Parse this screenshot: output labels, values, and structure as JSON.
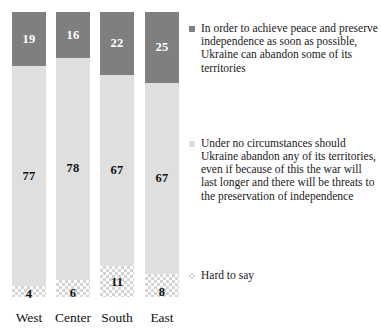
{
  "chart_data": {
    "type": "bar",
    "subtype": "stacked-100-percent",
    "title": "",
    "subtitle": "",
    "xlabel": "",
    "ylabel": "",
    "ylim": [
      0,
      100
    ],
    "grid": false,
    "legend_position": "right",
    "categories": [
      "West",
      "Center",
      "South",
      "East"
    ],
    "series": [
      {
        "name": "In order to achieve peace and preserve independence as soon as possible, Ukraine can abandon some of its territories",
        "short_name": "abandon-some-territories",
        "color": "#7f7f7f",
        "fill": "solid",
        "values": [
          19,
          16,
          22,
          25
        ]
      },
      {
        "name": "Under no circumstances should Ukraine abandon any of its territories, even if because of this the war will last longer and there will be threats to the preservation of independence",
        "short_name": "abandon-no-territories",
        "color": "#dfdfdf",
        "fill": "solid",
        "values": [
          77,
          78,
          67,
          67
        ]
      },
      {
        "name": "Hard to say",
        "short_name": "hard-to-say",
        "color": "#d5d5d5",
        "fill": "checkered",
        "values": [
          4,
          6,
          11,
          8
        ]
      }
    ]
  },
  "legend": {
    "items": [
      {
        "label": "In order to achieve peace and preserve independence as soon as possible, Ukraine can abandon some of its territories",
        "swatch": "dark-gray-square-icon",
        "color": "#7f7f7f"
      },
      {
        "label": "Under no circumstances should Ukraine abandon any of its territories, even if because of this the war will last longer and there will be threats to the preservation of independence",
        "swatch": "light-gray-square-icon",
        "color": "#dfdfdf"
      },
      {
        "label": "Hard to say",
        "swatch": "checkered-square-icon",
        "color": "#d5d5d5"
      }
    ]
  },
  "axis": {
    "categories": [
      "West",
      "Center",
      "South",
      "East"
    ]
  },
  "bars": [
    {
      "category": "West",
      "dark": "19",
      "light": "77",
      "check": "4"
    },
    {
      "category": "Center",
      "dark": "16",
      "light": "78",
      "check": "6"
    },
    {
      "category": "South",
      "dark": "22",
      "light": "67",
      "check": "11"
    },
    {
      "category": "East",
      "dark": "25",
      "light": "67",
      "check": "8"
    }
  ]
}
